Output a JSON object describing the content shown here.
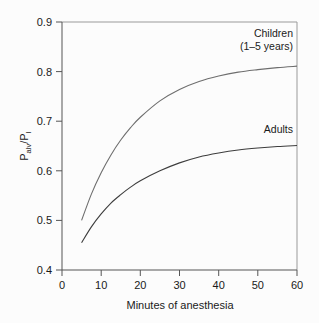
{
  "chart_data": {
    "type": "line",
    "title": "",
    "xlabel": "Minutes of anesthesia",
    "ylabel": "Palv/PI",
    "ylabel_parts": {
      "base1": "P",
      "sub1": "alv",
      "slash": "/P",
      "sub2": "I"
    },
    "xlim": [
      0,
      60
    ],
    "ylim": [
      0.4,
      0.9
    ],
    "xticks": [
      0,
      10,
      20,
      30,
      40,
      50,
      60
    ],
    "xtick_labels": [
      "0",
      "10",
      "20",
      "30",
      "40",
      "50",
      "60"
    ],
    "yticks": [
      0.4,
      0.5,
      0.6,
      0.7,
      0.8,
      0.9
    ],
    "ytick_labels": [
      "0.4",
      "0.5",
      "0.6",
      "0.7",
      "0.8",
      "0.9"
    ],
    "grid": false,
    "legend_position": "inline-annotations",
    "x": [
      5,
      7.5,
      10,
      12.5,
      15,
      17.5,
      20,
      25,
      30,
      35,
      40,
      45,
      50,
      55,
      60
    ],
    "series": [
      {
        "name": "Children (1-5 years)",
        "color": "#6e6e6e",
        "values": [
          0.5,
          0.553,
          0.596,
          0.632,
          0.662,
          0.687,
          0.708,
          0.741,
          0.764,
          0.78,
          0.791,
          0.799,
          0.804,
          0.808,
          0.811
        ]
      },
      {
        "name": "Adults",
        "color": "#3d3d3d",
        "values": [
          0.455,
          0.487,
          0.513,
          0.535,
          0.552,
          0.567,
          0.58,
          0.6,
          0.616,
          0.628,
          0.636,
          0.642,
          0.646,
          0.649,
          0.651
        ]
      }
    ],
    "annotations": [
      {
        "name": "children-label",
        "line1": "Children",
        "line2": "(1–5 years)",
        "x_data": 52,
        "y_data": 0.873
      },
      {
        "name": "adults-label",
        "text": "Adults",
        "x_data": 52,
        "y_data": 0.677
      }
    ]
  },
  "colors": {
    "background": "#fcfcfc",
    "axis": "#555555",
    "frame": "#9a9a9a",
    "text": "#1a1a1a",
    "children_curve": "#6e6e6e",
    "adults_curve": "#3d3d3d"
  }
}
